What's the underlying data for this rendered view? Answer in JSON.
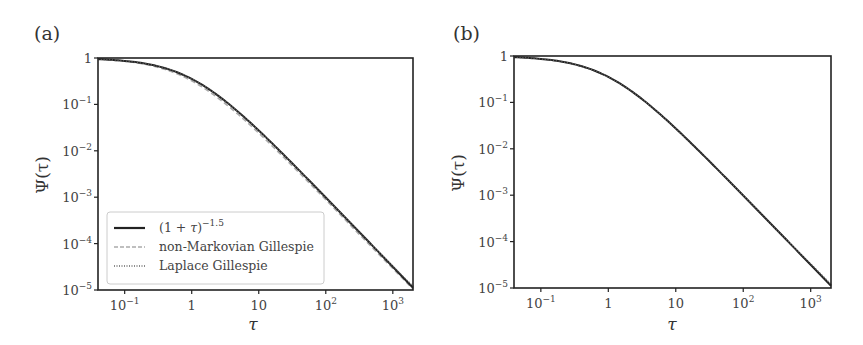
{
  "figure": {
    "panels": [
      {
        "label": "(a)"
      },
      {
        "label": "(b)"
      }
    ]
  },
  "chart_data": [
    {
      "type": "line",
      "panel": "(a)",
      "title": "",
      "xlabel": "τ",
      "ylabel": "Ψ(τ)",
      "xscale": "log",
      "yscale": "log",
      "xlim": [
        0.04,
        2000
      ],
      "ylim": [
        1e-05,
        1
      ],
      "x_ticks": [
        "10^-1",
        "1",
        "10",
        "10^2",
        "10^3"
      ],
      "y_ticks": [
        "1",
        "10^-1",
        "10^-2",
        "10^-3",
        "10^-4",
        "10^-5"
      ],
      "grid": false,
      "legend_position": "lower left",
      "legend": [
        "(1 + τ)^-1.5",
        "non-Markovian Gillespie",
        "Laplace Gillespie"
      ],
      "x": [
        0.04,
        0.1,
        0.3,
        1,
        3,
        10,
        30,
        100,
        300,
        1000,
        2000
      ],
      "series": [
        {
          "name": "(1 + τ)^-1.5",
          "style": "solid",
          "color": "#222222",
          "values": [
            0.943,
            0.867,
            0.675,
            0.354,
            0.125,
            0.0274,
            0.00579,
            0.000985,
            0.000192,
            3.16e-05,
            1.12e-05
          ]
        },
        {
          "name": "non-Markovian Gillespie",
          "style": "dashed",
          "color": "#aaaaaa",
          "values": [
            0.94,
            0.85,
            0.64,
            0.32,
            0.11,
            0.024,
            0.0051,
            0.00088,
            0.00017,
            2.9e-05,
            1.05e-05
          ]
        },
        {
          "name": "Laplace Gillespie",
          "style": "dotted",
          "color": "#666666",
          "values": [
            0.943,
            0.866,
            0.674,
            0.353,
            0.125,
            0.0273,
            0.0058,
            0.00099,
            0.00019,
            3.3e-05,
            1.2e-05
          ]
        }
      ]
    },
    {
      "type": "line",
      "panel": "(b)",
      "title": "",
      "xlabel": "τ",
      "ylabel": "Ψ(τ)",
      "xscale": "log",
      "yscale": "log",
      "xlim": [
        0.04,
        2000
      ],
      "ylim": [
        1e-05,
        1
      ],
      "x_ticks": [
        "10^-1",
        "1",
        "10",
        "10^2",
        "10^3"
      ],
      "y_ticks": [
        "1",
        "10^-1",
        "10^-2",
        "10^-3",
        "10^-4",
        "10^-5"
      ],
      "grid": false,
      "legend_position": "none",
      "x": [
        0.04,
        0.1,
        0.3,
        1,
        3,
        10,
        30,
        100,
        300,
        1000,
        2000
      ],
      "series": [
        {
          "name": "(1 + τ)^-1.5",
          "style": "solid",
          "color": "#222222",
          "values": [
            0.943,
            0.867,
            0.675,
            0.354,
            0.125,
            0.0274,
            0.00579,
            0.000985,
            0.000192,
            3.16e-05,
            1.12e-05
          ]
        },
        {
          "name": "non-Markovian Gillespie",
          "style": "dashed",
          "color": "#aaaaaa",
          "values": [
            0.943,
            0.866,
            0.674,
            0.353,
            0.125,
            0.0273,
            0.0058,
            0.00099,
            0.00019,
            3.2e-05,
            1.15e-05
          ]
        },
        {
          "name": "Laplace Gillespie",
          "style": "dotted",
          "color": "#666666",
          "values": [
            0.943,
            0.866,
            0.674,
            0.353,
            0.125,
            0.0273,
            0.0058,
            0.00099,
            0.00019,
            3.3e-05,
            1.2e-05
          ]
        }
      ]
    }
  ]
}
